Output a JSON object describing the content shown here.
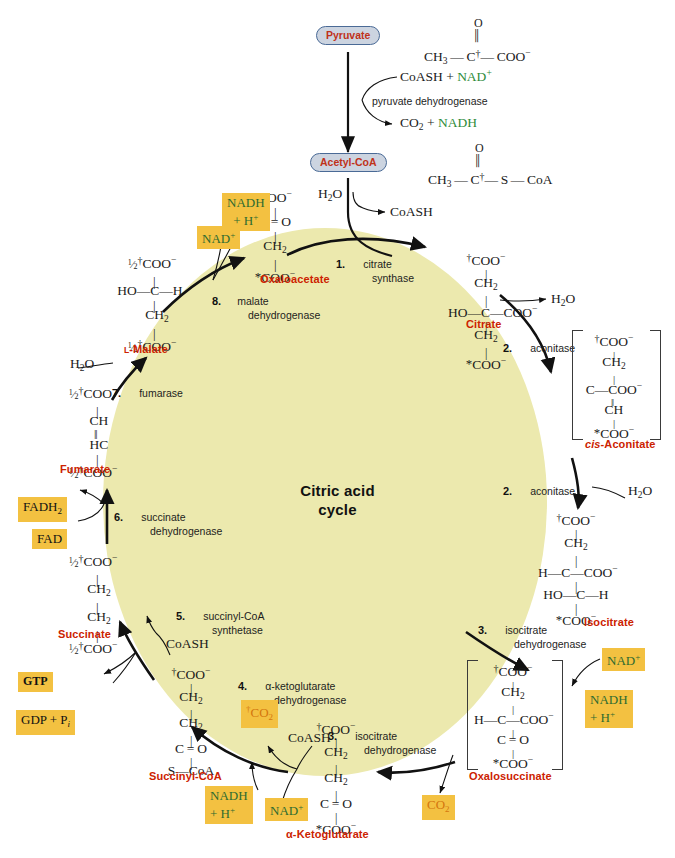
{
  "diagram": {
    "center_title": "Citric acid\ncycle",
    "center_title_line1": "Citric acid",
    "center_title_line2": "cycle",
    "disc_color": "#ece9ae",
    "accent_red": "#cc2200",
    "cofactor_box_color": "#f3c141",
    "cofactor_green": "#2d6b30",
    "cofactor_orange": "#d4760e",
    "pill_fill": "#ccd4e0",
    "pill_border": "#4a6a96"
  },
  "entry": {
    "pyruvate_label": "Pyruvate",
    "pyruvate_formula_ch3": "CH",
    "pyruvate_formula_ch3_sub": "3",
    "pyruvate_formula_o": "O",
    "pyruvate_formula_c": "C",
    "pyruvate_formula_coo": "COO",
    "pyruvate_formula_coo_sup": "−",
    "reactants": "CoASH + ",
    "reactants_nad": "NAD",
    "reactants_nad_sup": "+",
    "enzyme": "pyruvate dehydrogenase",
    "products_co2": "CO",
    "products_co2_sub": "2",
    "products_plus": " + ",
    "products_nadh": "NADH",
    "acetylcoa_label": "Acetyl-CoA",
    "acetylcoa_ch3": "CH",
    "acetylcoa_ch3_sub": "3",
    "acetylcoa_o": "O",
    "acetylcoa_c": "C",
    "acetylcoa_s": "S",
    "acetylcoa_coa": "CoA"
  },
  "steps": [
    {
      "num": "1.",
      "enzyme_line1": "citrate",
      "enzyme_line2": "synthase"
    },
    {
      "num": "2.",
      "enzyme_line1": "aconitase",
      "enzyme_line2": ""
    },
    {
      "num": "2.",
      "enzyme_line1": "aconitase",
      "enzyme_line2": ""
    },
    {
      "num": "3.",
      "enzyme_line1": "isocitrate",
      "enzyme_line2": "dehydrogenase"
    },
    {
      "num": "3.",
      "enzyme_line1": "isocitrate",
      "enzyme_line2": "dehydrogenase"
    },
    {
      "num": "4.",
      "enzyme_line1": "α-ketoglutarate",
      "enzyme_line2": "dehydrogenase"
    },
    {
      "num": "5.",
      "enzyme_line1": "succinyl-CoA",
      "enzyme_line2": "synthetase"
    },
    {
      "num": "6.",
      "enzyme_line1": "succinate",
      "enzyme_line2": "dehydrogenase"
    },
    {
      "num": "7.",
      "enzyme_line1": "fumarase",
      "enzyme_line2": ""
    },
    {
      "num": "8.",
      "enzyme_line1": "malate",
      "enzyme_line2": "dehydrogenase"
    }
  ],
  "metabolites": {
    "oxaloacetate": "Oxaloacetate",
    "citrate": "Citrate",
    "cis_aconitate_prefix": "cis",
    "cis_aconitate_rest": "-Aconitate",
    "isocitrate": "Isocitrate",
    "oxalosuccinate": "Oxalosuccinate",
    "alpha_ketoglutarate": "α-Ketoglutarate",
    "succinyl_coa": "Succinyl-CoA",
    "succinate": "Succinate",
    "fumarate": "Fumarate",
    "l_malate_prefix": "L",
    "l_malate_rest": "-Malate"
  },
  "cofactors": {
    "nadh_h_top": {
      "line1": "NADH",
      "line2": "+ H",
      "line2_sup": "+",
      "color": "green"
    },
    "nad_top": {
      "text": "NAD",
      "sup": "+",
      "color": "green"
    },
    "fadh2": {
      "text": "FADH",
      "sub": "2",
      "color": "black"
    },
    "fad": {
      "text": "FAD",
      "color": "black"
    },
    "gtp": {
      "text": "GTP",
      "color": "black"
    },
    "gdp_pi": {
      "text": "GDP + P",
      "ital_sub": "i",
      "color": "black"
    },
    "co2_step4": {
      "text": "CO",
      "sub": "2",
      "dagger": "†",
      "color": "orange"
    },
    "nadh_h_step4": {
      "line1": "NADH",
      "line2": "+ H",
      "line2_sup": "+",
      "color": "green"
    },
    "nad_step4": {
      "text": "NAD",
      "sup": "+",
      "color": "green"
    },
    "co2_step3": {
      "text": "CO",
      "sub": "2",
      "color": "orange"
    },
    "nad_step3": {
      "text": "NAD",
      "sup": "+",
      "color": "green"
    },
    "nadh_h_step3": {
      "line1": "NADH",
      "line2": "+ H",
      "line2_sup": "+",
      "color": "green"
    }
  },
  "small_molecules": {
    "h2o_citrate_synthase": "H₂O",
    "coash_citrate_synthase": "CoASH",
    "h2o_aconitase_1": "H₂O",
    "h2o_aconitase_2": "H₂O",
    "h2o_fumarase": "H₂O",
    "coash_step4": "CoASH",
    "coash_step5": "CoASH"
  },
  "formulas": {
    "oxaloacetate": [
      "COO⁻",
      "C=O",
      "CH₂",
      "*COO⁻"
    ],
    "citrate": [
      "†COO⁻",
      "CH₂",
      "HO—C—COO⁻",
      "CH₂",
      "*COO⁻"
    ],
    "cis_aconitate": [
      "†COO⁻",
      "CH₂",
      "C—COO⁻",
      "CH",
      "*COO⁻"
    ],
    "isocitrate": [
      "†COO⁻",
      "CH₂",
      "H—C—COO⁻",
      "HO—C—H",
      "*COO⁻"
    ],
    "oxalosuccinate": [
      "†COO⁻",
      "CH₂",
      "H—C—COO⁻",
      "C=O",
      "*COO⁻"
    ],
    "alpha_ketoglutarate": [
      "†COO⁻",
      "CH₂",
      "CH₂",
      "C=O",
      "*COO⁻"
    ],
    "succinyl_coa": [
      "†COO⁻",
      "CH₂",
      "CH₂",
      "C=O",
      "S—CoA"
    ],
    "succinate": [
      "½†COO⁻",
      "CH₂",
      "CH₂",
      "½†COO⁻"
    ],
    "fumarate": [
      "½†COO⁻",
      "CH",
      "HC",
      "½†COO⁻"
    ],
    "l_malate": [
      "½†COO⁻",
      "HO—C—H",
      "CH₂",
      "½†COO⁻"
    ]
  }
}
